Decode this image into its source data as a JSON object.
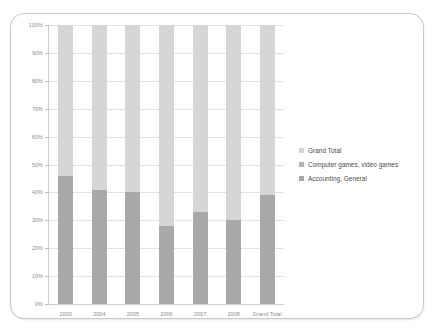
{
  "chart_data": {
    "type": "bar",
    "subtype": "100% stacked column",
    "title": "",
    "xlabel": "",
    "ylabel": "",
    "ylim": [
      0,
      100
    ],
    "y_unit": "%",
    "grid": true,
    "legend_position": "right",
    "categories": [
      "2003",
      "2004",
      "2005",
      "2006",
      "2007",
      "2008",
      "Grand Total"
    ],
    "y_ticks": [
      "0%",
      "10%",
      "20%",
      "30%",
      "40%",
      "50%",
      "60%",
      "70%",
      "80%",
      "90%",
      "100%"
    ],
    "y_tick_values": [
      0,
      10,
      20,
      30,
      40,
      50,
      60,
      70,
      80,
      90,
      100
    ],
    "series": [
      {
        "name": "Accounting, General",
        "color": "#a9a9a9",
        "values": [
          46,
          41,
          40,
          28,
          33,
          30,
          39
        ]
      },
      {
        "name": "Computer games, video games",
        "color": "#d6d6d6",
        "values": [
          54,
          59,
          60,
          72,
          67,
          70,
          61
        ]
      }
    ],
    "legend": [
      {
        "label": "Grand Total",
        "color": "#d6d6d6"
      },
      {
        "label": "Computer games, video games",
        "color": "#b4b4b4"
      },
      {
        "label": "Accounting, General",
        "color": "#a9a9a9"
      }
    ]
  }
}
